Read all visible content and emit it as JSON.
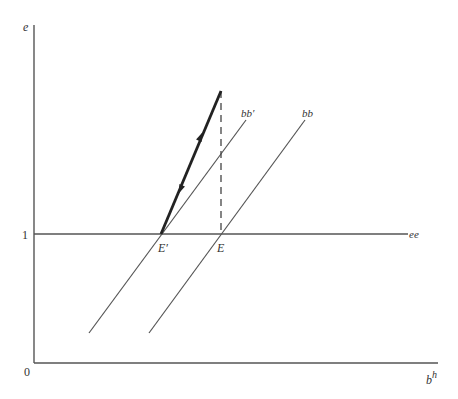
{
  "diagram": {
    "axes": {
      "y_label": "e",
      "x_label_base": "b",
      "x_label_sup": "h",
      "origin_label": "0",
      "y_tick_label": "1"
    },
    "lines": {
      "ee": {
        "label": "ee"
      },
      "bb_prime": {
        "label": "bb′"
      },
      "bb": {
        "label": "bb"
      }
    },
    "points": {
      "E_prime": {
        "label": "E′"
      },
      "E": {
        "label": "E"
      }
    },
    "path": {
      "description": "thick adjustment path from E′ up to point above E, with arrows up and down",
      "dashed": "vertical dashed line from top of path down to E"
    },
    "colors": {
      "axis": "#555555",
      "line": "#444444",
      "path": "#222222"
    }
  }
}
